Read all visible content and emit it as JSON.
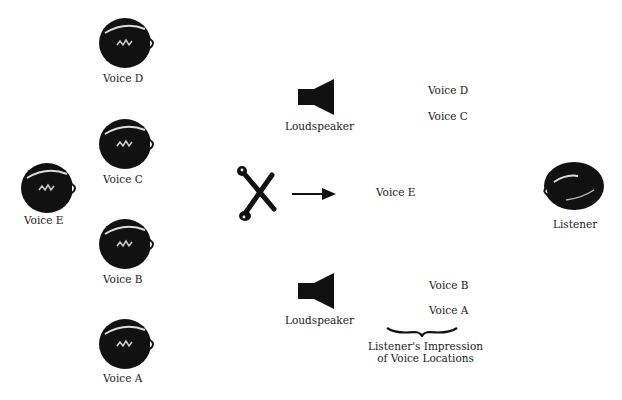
{
  "diagram": {
    "voices_left": [
      {
        "id": "D",
        "label": "Voice D",
        "x": 97,
        "y": 15,
        "label_y": 91
      },
      {
        "id": "C",
        "label": "Voice C",
        "x": 97,
        "y": 116,
        "label_y": 172
      },
      {
        "id": "E",
        "label": "Voice E",
        "x": 19,
        "y": 161,
        "label_y": 215
      },
      {
        "id": "B",
        "label": "Voice B",
        "x": 97,
        "y": 216,
        "label_y": 273
      },
      {
        "id": "A",
        "label": "Voice A",
        "x": 97,
        "y": 316,
        "label_y": 371
      }
    ],
    "microphone": {
      "icon": "crossed-microphones-icon"
    },
    "arrow": {
      "icon": "right-arrow-icon"
    },
    "loudspeakers": [
      {
        "label": "Loudspeaker",
        "position": "top"
      },
      {
        "label": "Loudspeaker",
        "position": "bottom"
      }
    ],
    "perceived_voices": [
      {
        "label": "Voice D",
        "x": 428,
        "y": 84
      },
      {
        "label": "Voice C",
        "x": 428,
        "y": 110
      },
      {
        "label": "Voice E",
        "x": 376,
        "y": 186
      },
      {
        "label": "Voice B",
        "x": 429,
        "y": 279
      },
      {
        "label": "Voice A",
        "x": 429,
        "y": 304
      }
    ],
    "brace_caption_line1": "Listener's Impression",
    "brace_caption_line2": "of Voice Locations",
    "listener": {
      "label": "Listener"
    }
  }
}
